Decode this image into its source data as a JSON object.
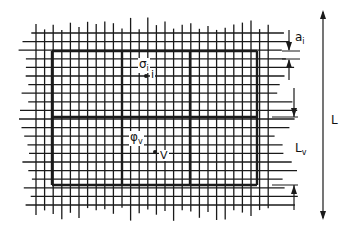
{
  "figure": {
    "title": "",
    "grid": {
      "thin_spacing_px": 8.6,
      "x_start": 36,
      "x_end": 272,
      "y_start": 33,
      "y_end": 205,
      "thick_x": [
        52,
        122,
        190,
        257
      ],
      "thick_y": [
        51,
        117,
        185
      ],
      "line_color": "#1a1a1a"
    },
    "labels": {
      "sigma_i": "σ",
      "sigma_i_sub": "i",
      "point_i": "i",
      "phi_v": "φ",
      "phi_v_sub": "v",
      "point_v": "V",
      "a_i": "a",
      "a_i_sub": "i",
      "L": "L",
      "L_v": "L",
      "L_v_sub": "v"
    }
  }
}
